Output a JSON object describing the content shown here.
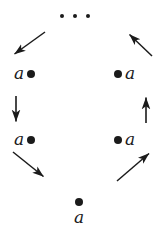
{
  "figure": {
    "kind": "quiver-cycle-diagram",
    "background_color": "#ffffff",
    "ink_color": "#1b1b1b",
    "width": 164,
    "height": 237
  },
  "ellipsis": {
    "name": "top-ellipsis",
    "glyph": "•",
    "count": 3,
    "text": "• • •",
    "x": 60,
    "y": 14
  },
  "nodes": [
    {
      "id": "node-upper-left",
      "label": "a",
      "dot_side": "right",
      "x": 14,
      "y": 65
    },
    {
      "id": "node-upper-right",
      "label": "a",
      "dot_side": "left",
      "x": 114,
      "y": 65
    },
    {
      "id": "node-lower-left",
      "label": "a",
      "dot_side": "right",
      "x": 14,
      "y": 131
    },
    {
      "id": "node-lower-right",
      "label": "a",
      "dot_side": "left",
      "x": 114,
      "y": 131
    },
    {
      "id": "node-bottom-center",
      "label": "a",
      "dot_side": "top",
      "x": 74,
      "y": 198
    }
  ],
  "arrows": [
    {
      "id": "arrow-top-left-incoming",
      "direction": "down-left",
      "glyph": "↙",
      "x1": 45,
      "y1": 32,
      "x2": 13,
      "y2": 55
    },
    {
      "id": "arrow-left-vertical",
      "direction": "down",
      "glyph": "↓",
      "x1": 16,
      "y1": 96,
      "x2": 16,
      "y2": 123
    },
    {
      "id": "arrow-bottom-left-outgoing",
      "direction": "down-right",
      "glyph": "↘",
      "x1": 13,
      "y1": 152,
      "x2": 45,
      "y2": 178
    },
    {
      "id": "arrow-bottom-right-incoming",
      "direction": "up-right",
      "glyph": "↗",
      "x1": 117,
      "y1": 180,
      "x2": 150,
      "y2": 152
    },
    {
      "id": "arrow-right-vertical",
      "direction": "up",
      "glyph": "↑",
      "x1": 146,
      "y1": 123,
      "x2": 146,
      "y2": 96
    },
    {
      "id": "arrow-top-right-outgoing",
      "direction": "up-left",
      "glyph": "↖",
      "x1": 152,
      "y1": 56,
      "x2": 128,
      "y2": 33
    }
  ]
}
